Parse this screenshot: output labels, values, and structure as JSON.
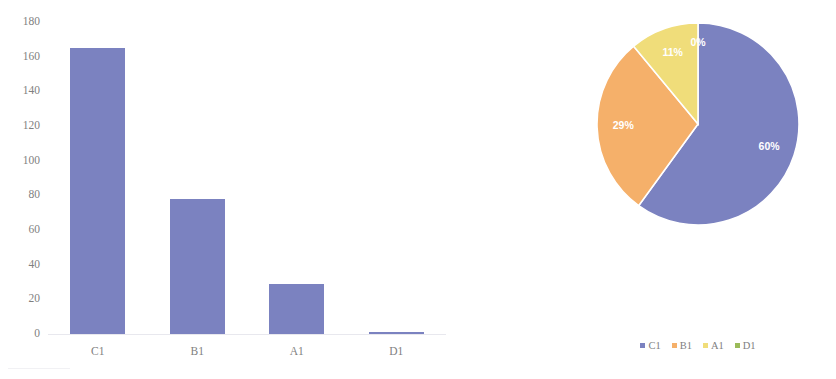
{
  "colors": {
    "series_c1": "#7b82c0",
    "series_b1": "#f5b06a",
    "series_a1": "#f0dd7a",
    "series_d1": "#9bbb59",
    "axis_text": "#7f7f7f",
    "label_text": "#ffffff",
    "background": "#ffffff"
  },
  "chart_data": [
    {
      "type": "bar",
      "title": "",
      "xlabel": "",
      "ylabel": "",
      "categories": [
        "C1",
        "B1",
        "A1",
        "D1"
      ],
      "values": [
        165,
        78,
        29,
        1
      ],
      "series": [
        {
          "name": "Count",
          "values": [
            165,
            78,
            29,
            1
          ],
          "color": "#7b82c0"
        }
      ],
      "ylim": [
        0,
        180
      ],
      "yticks": [
        180,
        160,
        140,
        120,
        100,
        80,
        60,
        40,
        20,
        0
      ],
      "ytick_labels": [
        "180",
        "160",
        "140",
        "120",
        "100",
        "80",
        "60",
        "40",
        "20",
        "0"
      ],
      "grid": false,
      "legend": "none"
    },
    {
      "type": "pie",
      "title": "",
      "labels": [
        "C1",
        "B1",
        "A1",
        "D1"
      ],
      "values": [
        60,
        29,
        11,
        0
      ],
      "data_labels": [
        "60%",
        "29%",
        "11%",
        "0%"
      ],
      "colors": [
        "#7b82c0",
        "#f5b06a",
        "#f0dd7a",
        "#9bbb59"
      ],
      "start_angle_deg": 0,
      "direction": "clockwise",
      "legend": "bottom",
      "legend_entries": [
        {
          "label": "C1",
          "color": "#7b82c0"
        },
        {
          "label": "B1",
          "color": "#f5b06a"
        },
        {
          "label": "A1",
          "color": "#f0dd7a"
        },
        {
          "label": "D1",
          "color": "#9bbb59"
        }
      ]
    }
  ]
}
